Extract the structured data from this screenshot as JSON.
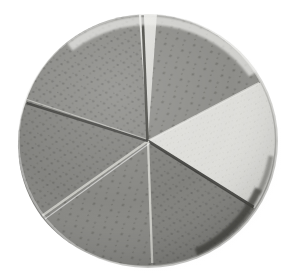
{
  "image": {
    "subject": "circular disc cut into six wedges",
    "background_color": "#ffffff",
    "alt_text": "A round speckled disc sliced into six wedge-shaped pieces, with one wedge a pale cream color and the remaining five a medium grey"
  },
  "disc": {
    "center_x": 148,
    "center_y": 141,
    "radius": 127,
    "rim_color": "#d8d8d4",
    "rim_highlight_color": "#ececea",
    "rim_shadow_color": "#4a4a48",
    "shadow_color": "#e6e6e4",
    "slice_count": 6,
    "cut_line_color": "#43433f",
    "cut_highlight_color": "#e2e2dd",
    "speckle_color": "#5c5c58"
  },
  "slices": [
    {
      "id": "slice-1",
      "label": "top-right wedge",
      "start_angle": -86,
      "end_angle": -28,
      "fill": "#8c8c88",
      "texture": "speckled",
      "highlighted": false
    },
    {
      "id": "slice-2",
      "label": "right pale wedge",
      "start_angle": -28,
      "end_angle": 33,
      "fill": "#dedeDA",
      "texture": "fine-grain",
      "highlighted": true
    },
    {
      "id": "slice-3",
      "label": "lower-right wedge",
      "start_angle": 33,
      "end_angle": 88,
      "fill": "#7f7f7b",
      "texture": "speckled",
      "highlighted": false
    },
    {
      "id": "slice-4",
      "label": "bottom wedge",
      "start_angle": 88,
      "end_angle": 147,
      "fill": "#868682",
      "texture": "speckled",
      "highlighted": false
    },
    {
      "id": "slice-5",
      "label": "lower-left wedge",
      "start_angle": 147,
      "end_angle": 197,
      "fill": "#82827e",
      "texture": "speckled",
      "highlighted": false
    },
    {
      "id": "slice-6",
      "label": "upper-left wedge",
      "start_angle": 197,
      "end_angle": 274,
      "fill": "#8a8a86",
      "texture": "speckled",
      "highlighted": false
    }
  ],
  "cuts": [
    {
      "id": "cut-1",
      "angle": -86,
      "style": "dark"
    },
    {
      "id": "cut-2",
      "angle": -28,
      "style": "light"
    },
    {
      "id": "cut-3",
      "angle": 33,
      "style": "dark"
    },
    {
      "id": "cut-4",
      "angle": 88,
      "style": "light"
    },
    {
      "id": "cut-5",
      "angle": 147,
      "style": "light"
    },
    {
      "id": "cut-6",
      "angle": 197,
      "style": "dark"
    }
  ]
}
